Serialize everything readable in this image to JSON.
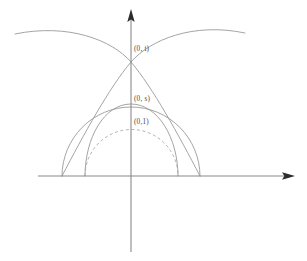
{
  "figure": {
    "background_color": "#ffffff",
    "axis_color": "#8a8a8a",
    "curve_color": "#9a9a9a",
    "dashed_curve_color": "#a8a8a8",
    "label_color": "#4a4a4a",
    "origin": {
      "x": 131,
      "y": 176
    },
    "labels": [
      {
        "id": "t",
        "text": "(0, t)",
        "x": 134,
        "y": 51
      },
      {
        "id": "s",
        "text": "(0, s)",
        "x": 134,
        "y": 101
      },
      {
        "id": "one",
        "text": "(0,1)",
        "x": 134,
        "y": 124
      }
    ],
    "axes": {
      "y_axis": {
        "name": "vertical-axis",
        "x1": 131,
        "y1": 252,
        "x2": 131,
        "y2": 12
      },
      "x_axis": {
        "name": "horizontal-axis",
        "x1": 38,
        "y1": 176,
        "x2": 292,
        "y2": 176
      }
    },
    "curves": [
      {
        "id": "outer-semicircle",
        "style": "solid",
        "description": "large solid semicircle on the x-axis",
        "left_foot_x": 62,
        "right_foot_x": 200,
        "apex_y": 107
      },
      {
        "id": "left-arc",
        "style": "solid",
        "description": "arc from left of x-axis rising over the crossing point",
        "start_x": 15,
        "start_y": 34,
        "end_x": 200,
        "end_y": 176
      },
      {
        "id": "right-arc",
        "style": "solid",
        "description": "arc from right upper area down to left foot on x-axis",
        "start_x": 245,
        "start_y": 33,
        "end_x": 62,
        "end_y": 176
      },
      {
        "id": "middle-semicircle",
        "style": "solid",
        "description": "middle solid semicircle apex at (0, s)",
        "left_foot_x": 85,
        "right_foot_x": 178,
        "apex_y": 104
      },
      {
        "id": "unit-semicircle",
        "style": "dashed",
        "description": "dashed semicircle apex at (0,1)",
        "left_foot_x": 85,
        "right_foot_x": 178,
        "apex_y": 124
      }
    ],
    "crossing_point": {
      "x": 131,
      "y": 62
    }
  }
}
